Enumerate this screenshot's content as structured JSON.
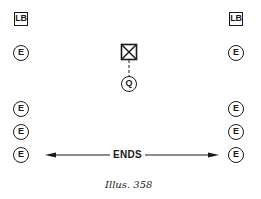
{
  "diagram": {
    "type": "lighting-layout-plan",
    "symbols": {
      "left_column": {
        "top_box": {
          "label": "LB",
          "shape": "square"
        },
        "circles": [
          {
            "label": "E"
          },
          {
            "label": "E"
          },
          {
            "label": "E"
          },
          {
            "label": "E"
          }
        ]
      },
      "right_column": {
        "top_box": {
          "label": "LB",
          "shape": "square"
        },
        "circles": [
          {
            "label": "E"
          },
          {
            "label": "E"
          },
          {
            "label": "E"
          },
          {
            "label": "E"
          }
        ]
      },
      "center": {
        "box": {
          "label": "",
          "shape": "square-with-x"
        },
        "connector": "dashed-line",
        "circle": {
          "label": "Q"
        }
      }
    },
    "dimension_arrow": {
      "label": "ENDS",
      "direction": "bidirectional"
    },
    "caption": "Illus. 358"
  },
  "colors": {
    "ink": "#1a1a1a",
    "background": "#ffffff"
  }
}
